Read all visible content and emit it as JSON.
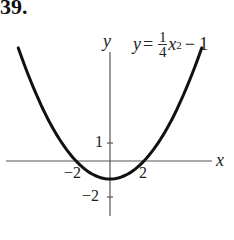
{
  "problem_number": "39.",
  "chart_data": {
    "type": "line",
    "equation": {
      "lhs": "y",
      "equals": "=",
      "numerator": "1",
      "denominator": "4",
      "var": "x",
      "exp": "2",
      "tail": "− 1"
    },
    "xlabel": "x",
    "ylabel": "y",
    "x_ticks": [
      {
        "value": -2,
        "label": "−2"
      },
      {
        "value": 2,
        "label": "2"
      }
    ],
    "y_ticks": [
      {
        "value": 1,
        "label": "1"
      },
      {
        "value": -2,
        "label": "−2"
      }
    ],
    "xlim": [
      -6.3,
      6.8
    ],
    "ylim": [
      -3,
      6
    ],
    "grid": false,
    "series": [
      {
        "name": "y = 1/4 x^2 - 1",
        "x": [
          -5.4,
          -4,
          -3,
          -2,
          -1,
          0,
          1,
          2,
          3,
          4,
          5.4
        ],
        "y": [
          6.29,
          3,
          1.25,
          0,
          -0.75,
          -1,
          -0.75,
          0,
          1.25,
          3,
          6.29
        ]
      }
    ]
  }
}
